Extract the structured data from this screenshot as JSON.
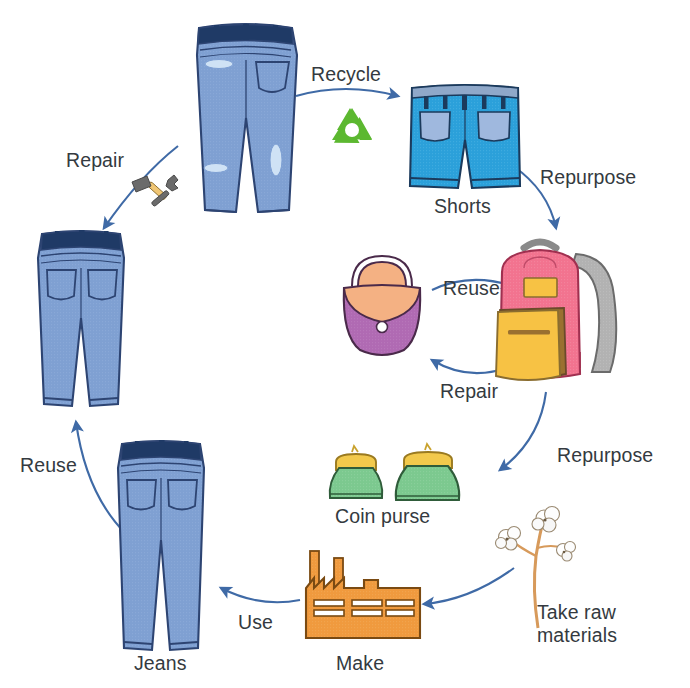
{
  "diagram": {
    "type": "cycle-diagram",
    "background_color": "#ffffff",
    "arrow_color": "#4a6fa5",
    "label_text_color": "#343a40"
  },
  "labels": {
    "recycle": "Recycle",
    "repair_top_left": "Repair",
    "repurpose_top_right": "Repurpose",
    "reuse_middle": "Reuse",
    "repair_middle": "Repair",
    "repurpose_lower_right": "Repurpose",
    "reuse_left": "Reuse",
    "use": "Use",
    "take_raw_materials": "Take raw materials"
  },
  "nodes": [
    {
      "id": "torn-jeans",
      "label": "",
      "icon": "torn-jeans-icon",
      "colors": {
        "denim": "#7d9fd3",
        "outline": "#2d4472",
        "waistband": "#1f3a66",
        "rip": "#cfe2f5"
      }
    },
    {
      "id": "shorts",
      "label": "Shorts",
      "icon": "denim-shorts-icon",
      "colors": {
        "denim": "#2a9fd8",
        "outline": "#1b3a5c",
        "pocket": "#9fb8de"
      }
    },
    {
      "id": "backpack",
      "label": "",
      "icon": "backpack-icon",
      "colors": {
        "body": "#f2738f",
        "pocket": "#f7c244",
        "strap": "#b0b0b0",
        "outline": "#6b4a2a"
      }
    },
    {
      "id": "handbag",
      "label": "",
      "icon": "handbag-icon",
      "colors": {
        "body": "#b06ab3",
        "flap": "#f4b183",
        "clasp": "#ffffff",
        "outline": "#4a2a4a"
      }
    },
    {
      "id": "coin-purse",
      "label": "Coin purse",
      "icon": "coin-purse-icon",
      "count": 2,
      "colors": {
        "body": "#7cc98f",
        "frame": "#f2c94c",
        "outline": "#2f5c3a"
      }
    },
    {
      "id": "cotton-plant",
      "label": "Take raw materials",
      "icon": "cotton-plant-icon",
      "colors": {
        "boll": "#ffffff",
        "stem": "#d79a5b",
        "outline": "#8a7a66"
      }
    },
    {
      "id": "factory",
      "label": "Make",
      "icon": "factory-icon",
      "colors": {
        "body": "#f09a3e",
        "outline": "#7a4a12",
        "window": "#ffffff"
      }
    },
    {
      "id": "new-jeans",
      "label": "Jeans",
      "icon": "jeans-icon",
      "colors": {
        "denim": "#7d9fd3",
        "outline": "#2d4472",
        "waistband": "#1f3a66"
      }
    },
    {
      "id": "repaired-jeans",
      "label": "",
      "icon": "jeans-icon",
      "colors": {
        "denim": "#7d9fd3",
        "outline": "#2d4472",
        "waistband": "#1f3a66"
      }
    },
    {
      "id": "recycle-symbol",
      "label": "",
      "icon": "recycle-symbol-icon",
      "colors": {
        "green": "#5cb830"
      }
    },
    {
      "id": "repair-tools",
      "label": "",
      "icon": "hammer-wrench-icon",
      "colors": {
        "metal": "#6b6b6b",
        "handle": "#f0c674"
      }
    }
  ],
  "node_labels": {
    "shorts": "Shorts",
    "coin_purse": "Coin purse",
    "make": "Make",
    "jeans": "Jeans"
  },
  "flow": [
    {
      "from": "torn-jeans",
      "to": "shorts",
      "label": "Recycle"
    },
    {
      "from": "torn-jeans",
      "to": "repaired-jeans",
      "label": "Repair"
    },
    {
      "from": "shorts",
      "to": "backpack",
      "label": "Repurpose"
    },
    {
      "from": "handbag",
      "to": "backpack",
      "label": "Reuse"
    },
    {
      "from": "backpack",
      "to": "handbag",
      "label": "Repair"
    },
    {
      "from": "backpack",
      "to": "coin-purse",
      "label": "Repurpose"
    },
    {
      "from": "cotton-plant",
      "to": "factory",
      "label": ""
    },
    {
      "from": "factory",
      "to": "new-jeans",
      "label": "Use"
    },
    {
      "from": "new-jeans",
      "to": "repaired-jeans",
      "label": "Reuse"
    }
  ]
}
